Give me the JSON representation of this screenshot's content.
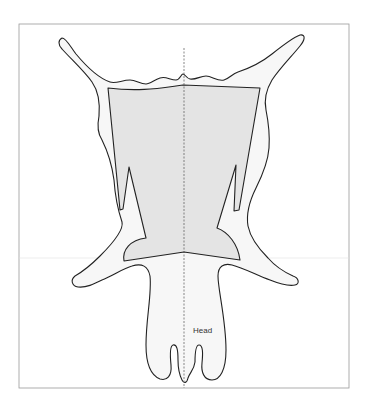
{
  "figure": {
    "type": "hide-cutting-diagram",
    "labels": {
      "head": "Head"
    },
    "regions": [
      {
        "name": "outer-hide",
        "fill": "#f7f7f7",
        "stroke": "#222222"
      },
      {
        "name": "center-panel",
        "fill": "#e4e4e4",
        "stroke": "#222222"
      }
    ],
    "center_line": {
      "style": "dashed",
      "color": "#555555"
    },
    "frame": {
      "color": "#9a9a9a"
    }
  }
}
